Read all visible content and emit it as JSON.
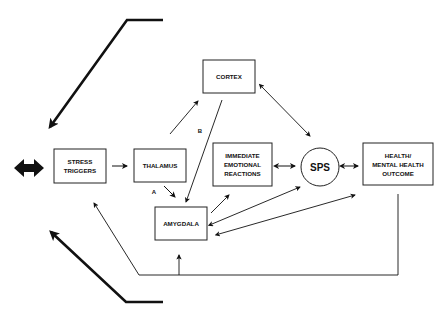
{
  "diagram": {
    "nodes": {
      "stress": {
        "lines": [
          "STRESS",
          "TRIGGERS"
        ]
      },
      "thalamus": {
        "lines": [
          "THALAMUS"
        ]
      },
      "cortex": {
        "lines": [
          "CORTEX"
        ]
      },
      "amygdala": {
        "lines": [
          "AMYGDALA"
        ]
      },
      "immediate": {
        "lines": [
          "IMMEDIATE",
          "EMOTIONAL",
          "REACTIONS"
        ]
      },
      "sps": {
        "lines": [
          "SPS"
        ]
      },
      "health": {
        "lines": [
          "HEALTH/",
          "MENTAL HEALTH",
          "OUTCOME"
        ]
      }
    },
    "edge_labels": {
      "a": "A",
      "b": "B"
    },
    "edges": [
      {
        "from": "stress",
        "to": "thalamus",
        "type": "directed"
      },
      {
        "from": "thalamus",
        "to": "cortex",
        "type": "directed",
        "label": ""
      },
      {
        "from": "thalamus",
        "to": "amygdala",
        "type": "directed",
        "label": "A"
      },
      {
        "from": "cortex",
        "to": "amygdala",
        "type": "directed",
        "label": "B"
      },
      {
        "from": "cortex",
        "to": "sps",
        "type": "bidirectional"
      },
      {
        "from": "immediate",
        "to": "sps",
        "type": "bidirectional"
      },
      {
        "from": "sps",
        "to": "health",
        "type": "bidirectional"
      },
      {
        "from": "amygdala",
        "to": "immediate",
        "type": "directed"
      },
      {
        "from": "amygdala",
        "to": "sps",
        "type": "bidirectional"
      },
      {
        "from": "amygdala",
        "to": "health",
        "type": "bidirectional"
      },
      {
        "from": "health",
        "to": "stress",
        "type": "feedback"
      },
      {
        "from": "health",
        "to": "amygdala",
        "type": "feedback"
      }
    ],
    "cycle_indicator": "bidirectional-thick-arrow"
  }
}
